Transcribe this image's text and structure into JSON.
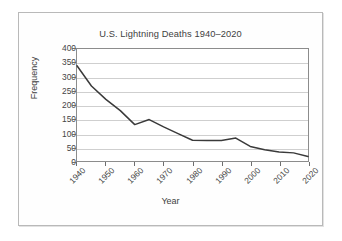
{
  "chart_data": {
    "type": "line",
    "title": "U.S. Lightning Deaths 1940–2020",
    "xlabel": "Year",
    "ylabel": "Frequency",
    "xlim": [
      1940,
      2020
    ],
    "ylim": [
      0,
      400
    ],
    "grid": true,
    "legend": "none",
    "line_color": "#3a3a3a",
    "grid_color": "#cfcfcf",
    "axis_color": "#8c8c8c",
    "background_color": "#ffffff",
    "y_ticks": [
      0,
      50,
      100,
      150,
      200,
      250,
      300,
      350,
      400
    ],
    "x_ticks": [
      1940,
      1950,
      1960,
      1970,
      1980,
      1990,
      2000,
      2010,
      2020
    ],
    "x": [
      1940,
      1945,
      1950,
      1955,
      1960,
      1965,
      1970,
      1975,
      1980,
      1985,
      1990,
      1995,
      2000,
      2005,
      2010,
      2015,
      2020
    ],
    "values": [
      340,
      268,
      220,
      180,
      130,
      148,
      122,
      98,
      74,
      73,
      73,
      82,
      52,
      40,
      32,
      29,
      16
    ],
    "series": [
      {
        "name": "U.S. Lightning Deaths",
        "values": [
          340,
          268,
          220,
          180,
          130,
          148,
          122,
          98,
          74,
          73,
          73,
          82,
          52,
          40,
          32,
          29,
          16
        ]
      }
    ]
  }
}
